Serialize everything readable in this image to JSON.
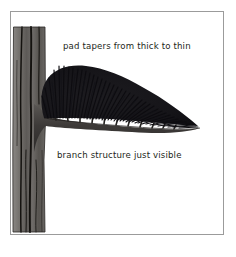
{
  "figure": {
    "background_color": "#ffffff",
    "frame_color": "#9b9b9b",
    "ink_color": "#231f20"
  },
  "labels": {
    "pad_taper": "pad tapers from thick to thin",
    "branch_structure": "branch structure just visible"
  },
  "illustration": {
    "trunk_name": "tree-trunk",
    "branch_name": "horizontal-branch",
    "foliage_name": "foliage-pad",
    "trunk_color": "#6d6a67",
    "trunk_shadow_color": "#4a4745",
    "branch_color": "#454241",
    "foliage_color": "#17161a"
  }
}
